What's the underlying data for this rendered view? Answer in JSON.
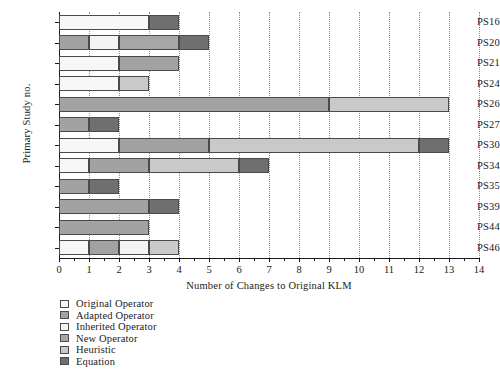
{
  "chart_data": {
    "type": "bar",
    "orientation": "horizontal",
    "stacked": true,
    "title": "",
    "xlabel": "Number of Changes to Original KLM",
    "ylabel": "Primary Study no.",
    "xlim": [
      0,
      14
    ],
    "xticks": [
      0,
      1,
      2,
      3,
      4,
      5,
      6,
      7,
      8,
      9,
      10,
      11,
      12,
      13,
      14
    ],
    "xtick_labels": [
      "0",
      "1",
      "2",
      "3",
      "4",
      "5",
      "6",
      "7",
      "8",
      "9",
      "10",
      "11",
      "12",
      "13",
      "14"
    ],
    "grid": "vertical-dotted",
    "legend_position": "below-left",
    "categories": [
      "PS16",
      "PS20",
      "PS21",
      "PS24",
      "PS26",
      "PS27",
      "PS30",
      "PS34",
      "PS35",
      "PS39",
      "PS44",
      "PS46"
    ],
    "series": [
      {
        "name": "Original Operator",
        "color": "#f7f7f5",
        "values": [
          3,
          0,
          2,
          2,
          0,
          0,
          2,
          1,
          0,
          0,
          0,
          1
        ]
      },
      {
        "name": "Adapted Operator",
        "color": "#a2a2a2",
        "values": [
          0,
          1,
          2,
          0,
          9,
          1,
          3,
          2,
          1,
          3,
          3,
          1
        ]
      },
      {
        "name": "Inherited Operator",
        "color": "#f4f4f2",
        "values": [
          0,
          1,
          0,
          0,
          0,
          0,
          0,
          0,
          0,
          0,
          0,
          1
        ]
      },
      {
        "name": "New Operator",
        "color": "#a6a6a6",
        "values": [
          0,
          2,
          0,
          0,
          0,
          0,
          0,
          0,
          0,
          0,
          0,
          0
        ]
      },
      {
        "name": "Heuristic",
        "color": "#c9c9c7",
        "values": [
          0,
          0,
          0,
          1,
          4,
          0,
          7,
          3,
          0,
          0,
          0,
          1
        ]
      },
      {
        "name": "Equation",
        "color": "#6f6f6f",
        "values": [
          1,
          1,
          0,
          0,
          0,
          1,
          1,
          1,
          1,
          1,
          0,
          0
        ]
      }
    ],
    "bar_segments": [
      {
        "category": "PS16",
        "segments": [
          {
            "series": "Original Operator",
            "start": 0,
            "end": 3
          },
          {
            "series": "Equation",
            "start": 3,
            "end": 4
          }
        ],
        "total": 4
      },
      {
        "category": "PS20",
        "segments": [
          {
            "series": "Adapted Operator",
            "start": 0,
            "end": 1
          },
          {
            "series": "Inherited Operator",
            "start": 1,
            "end": 2
          },
          {
            "series": "New Operator",
            "start": 2,
            "end": 4
          },
          {
            "series": "Equation",
            "start": 4,
            "end": 5
          }
        ],
        "total": 5
      },
      {
        "category": "PS21",
        "segments": [
          {
            "series": "Original Operator",
            "start": 0,
            "end": 2
          },
          {
            "series": "Adapted Operator",
            "start": 2,
            "end": 4
          }
        ],
        "total": 4
      },
      {
        "category": "PS24",
        "segments": [
          {
            "series": "Original Operator",
            "start": 0,
            "end": 2
          },
          {
            "series": "Heuristic",
            "start": 2,
            "end": 3
          }
        ],
        "total": 3
      },
      {
        "category": "PS26",
        "segments": [
          {
            "series": "Adapted Operator",
            "start": 0,
            "end": 9
          },
          {
            "series": "Heuristic",
            "start": 9,
            "end": 13
          }
        ],
        "total": 13
      },
      {
        "category": "PS27",
        "segments": [
          {
            "series": "Adapted Operator",
            "start": 0,
            "end": 1
          },
          {
            "series": "Equation",
            "start": 1,
            "end": 2
          }
        ],
        "total": 2
      },
      {
        "category": "PS30",
        "segments": [
          {
            "series": "Original Operator",
            "start": 0,
            "end": 2
          },
          {
            "series": "Adapted Operator",
            "start": 2,
            "end": 5
          },
          {
            "series": "Heuristic",
            "start": 5,
            "end": 12
          },
          {
            "series": "Equation",
            "start": 12,
            "end": 13
          }
        ],
        "total": 13
      },
      {
        "category": "PS34",
        "segments": [
          {
            "series": "Original Operator",
            "start": 0,
            "end": 1
          },
          {
            "series": "Adapted Operator",
            "start": 1,
            "end": 3
          },
          {
            "series": "Heuristic",
            "start": 3,
            "end": 6
          },
          {
            "series": "Equation",
            "start": 6,
            "end": 7
          }
        ],
        "total": 7
      },
      {
        "category": "PS35",
        "segments": [
          {
            "series": "Adapted Operator",
            "start": 0,
            "end": 1
          },
          {
            "series": "Equation",
            "start": 1,
            "end": 2
          }
        ],
        "total": 2
      },
      {
        "category": "PS39",
        "segments": [
          {
            "series": "Adapted Operator",
            "start": 0,
            "end": 3
          },
          {
            "series": "Equation",
            "start": 3,
            "end": 4
          }
        ],
        "total": 4
      },
      {
        "category": "PS44",
        "segments": [
          {
            "series": "Adapted Operator",
            "start": 0,
            "end": 3
          }
        ],
        "total": 3
      },
      {
        "category": "PS46",
        "segments": [
          {
            "series": "Original Operator",
            "start": 0,
            "end": 1
          },
          {
            "series": "Adapted Operator",
            "start": 1,
            "end": 2
          },
          {
            "series": "Inherited Operator",
            "start": 2,
            "end": 3
          },
          {
            "series": "Heuristic",
            "start": 3,
            "end": 4
          }
        ],
        "total": 4
      }
    ]
  },
  "legend": {
    "items": [
      {
        "label": "Original Operator",
        "color": "#f7f7f5"
      },
      {
        "label": "Adapted Operator",
        "color": "#a2a2a2"
      },
      {
        "label": "Inherited Operator",
        "color": "#f4f4f2"
      },
      {
        "label": "New Operator",
        "color": "#a6a6a6"
      },
      {
        "label": "Heuristic",
        "color": "#c9c9c7"
      },
      {
        "label": "Equation",
        "color": "#6f6f6f"
      }
    ]
  }
}
